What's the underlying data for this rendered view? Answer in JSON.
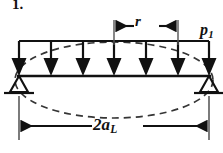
{
  "figure": {
    "item_number": "1.",
    "caption_labels": {
      "load_intensity": "p",
      "load_intensity_sub": "1",
      "segment_dim": "r",
      "span_dim": "2a",
      "span_dim_sub": "L"
    },
    "colors": {
      "line": "#111111",
      "dashed": "#3a3a3a",
      "background": "#ffffff"
    },
    "geometry": {
      "beam_left_x": 19,
      "beam_right_x": 209,
      "beam_y": 76,
      "load_top_y": 41,
      "support_base_y": 93,
      "arrow_count": 7,
      "arrow_x_positions": [
        19,
        51,
        83,
        114,
        146,
        178,
        209
      ],
      "r_dim_left_x": 114,
      "r_dim_right_x": 178,
      "r_dim_y": 26,
      "span_dim_y": 126,
      "ellipse_cx": 114,
      "ellipse_cy": 80,
      "ellipse_rx": 100,
      "ellipse_ry": 38
    }
  }
}
